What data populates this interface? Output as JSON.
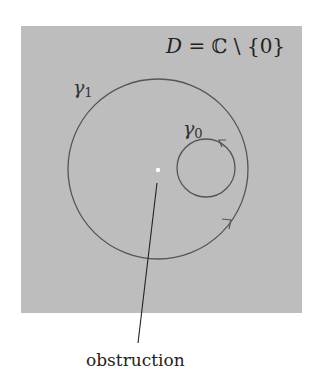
{
  "diagram": {
    "domain_label": {
      "D": "D",
      "eq": " = ",
      "C": "ℂ",
      "rest": " \\ {0}"
    },
    "curves": [
      {
        "name": "gamma_1",
        "symbol": "γ",
        "subscript": "1",
        "type": "circle",
        "center": [
          158,
          169
        ],
        "radius": 90,
        "orientation": "counter-clockwise"
      },
      {
        "name": "gamma_0",
        "symbol": "γ",
        "subscript": "0",
        "type": "circle",
        "center": [
          206,
          168
        ],
        "radius": 29,
        "orientation": "counter-clockwise"
      }
    ],
    "puncture": {
      "label": "obstruction",
      "point": [
        158,
        170
      ]
    },
    "colors": {
      "region": "#bdbdbd",
      "curve": "#555555",
      "pointer": "#222222",
      "puncture": "#ffffff"
    }
  }
}
